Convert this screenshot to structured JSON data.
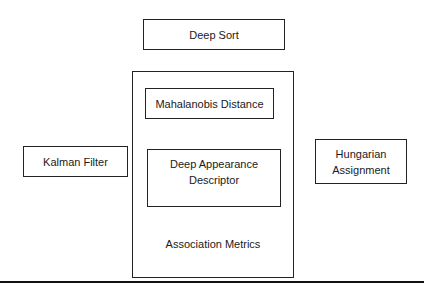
{
  "diagram": {
    "title_box": {
      "label": "Deep Sort"
    },
    "container": {
      "caption": "Association Metrics",
      "children": [
        {
          "label": "Mahalanobis Distance"
        },
        {
          "label": "Deep Appearance Descriptor",
          "lines": [
            "Deep Appearance",
            "Descriptor"
          ]
        }
      ]
    },
    "left_box": {
      "label": "Kalman Filter"
    },
    "right_box": {
      "label": "Hungarian Assignment",
      "lines": [
        "Hungarian",
        "Assignment"
      ]
    }
  }
}
